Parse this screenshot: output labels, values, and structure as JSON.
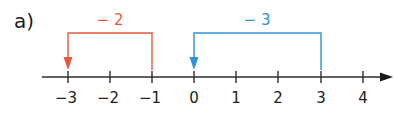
{
  "part_label": "a)",
  "number_line": {
    "ticks": [
      "−3",
      "−2",
      "−1",
      "0",
      "1",
      "2",
      "3",
      "4"
    ],
    "axis_color": "#2b2b2b"
  },
  "jumps": [
    {
      "label": "− 2",
      "from": "−1",
      "to": "−3",
      "color": "#e8583f"
    },
    {
      "label": "− 3",
      "from": "3",
      "to": "0",
      "color": "#2e93d8"
    }
  ]
}
